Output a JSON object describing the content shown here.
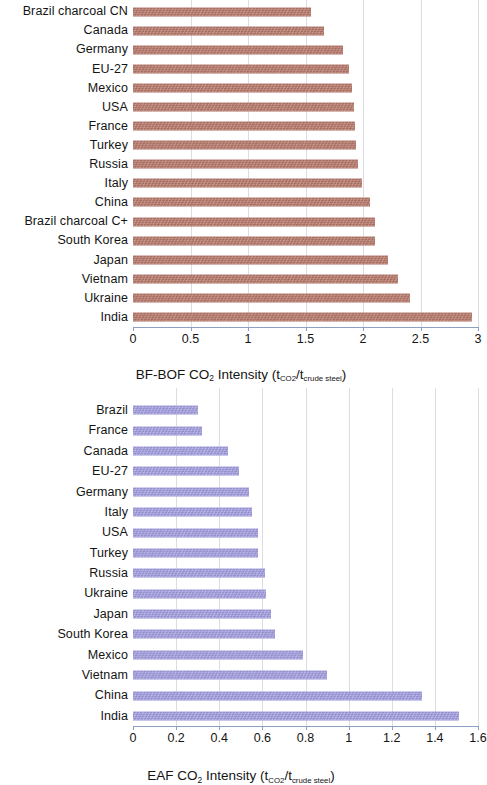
{
  "chart_data": [
    {
      "type": "bar",
      "orientation": "horizontal",
      "id": "bf-bof",
      "title": "",
      "xlabel": "BF-BOF CO2 Intensity (tCO2/tcrude steel)",
      "xlabel_parts": {
        "prefix": "BF-BOF CO",
        "co2_sub": "2",
        "middle": " Intensity (t",
        "unit_sub_1": "CO2",
        "slash": "/t",
        "unit_sub_2": "crude steel",
        "suffix": ")"
      },
      "ylabel": "",
      "xlim": [
        0,
        3
      ],
      "xticks": [
        0,
        0.5,
        1,
        1.5,
        2,
        2.5,
        3
      ],
      "xtick_labels": [
        "0",
        "0.5",
        "1",
        "1.5",
        "2",
        "2.5",
        "3"
      ],
      "grid": true,
      "bar_color": "#b5776a",
      "categories": [
        "Brazil charcoal CN",
        "Canada",
        "Germany",
        "EU-27",
        "Mexico",
        "USA",
        "France",
        "Turkey",
        "Russia",
        "Italy",
        "China",
        "Brazil charcoal C+",
        "South Korea",
        "Japan",
        "Vietnam",
        "Ukraine",
        "India"
      ],
      "values": [
        1.55,
        1.66,
        1.83,
        1.88,
        1.9,
        1.92,
        1.93,
        1.94,
        1.96,
        1.99,
        2.06,
        2.1,
        2.1,
        2.22,
        2.3,
        2.41,
        2.95
      ]
    },
    {
      "type": "bar",
      "orientation": "horizontal",
      "id": "eaf",
      "title": "",
      "xlabel": "EAF CO2 Intensity (tCO2/tcrude steel)",
      "xlabel_parts": {
        "prefix": "EAF CO",
        "co2_sub": "2",
        "middle": " Intensity (t",
        "unit_sub_1": "CO2",
        "slash": "/t",
        "unit_sub_2": "crude steel",
        "suffix": ")"
      },
      "ylabel": "",
      "xlim": [
        0,
        1.6
      ],
      "xticks": [
        0,
        0.2,
        0.4,
        0.6,
        0.8,
        1,
        1.2,
        1.4,
        1.6
      ],
      "xtick_labels": [
        "0",
        "0.2",
        "0.4",
        "0.6",
        "0.8",
        "1",
        "1.2",
        "1.4",
        "1.6"
      ],
      "grid": true,
      "bar_color": "#9e9adb",
      "categories": [
        "Brazil",
        "France",
        "Canada",
        "EU-27",
        "Germany",
        "Italy",
        "USA",
        "Turkey",
        "Russia",
        "Ukraine",
        "Japan",
        "South Korea",
        "Mexico",
        "Vietnam",
        "China",
        "India"
      ],
      "values": [
        0.3,
        0.32,
        0.44,
        0.49,
        0.54,
        0.55,
        0.58,
        0.58,
        0.61,
        0.615,
        0.64,
        0.66,
        0.79,
        0.9,
        1.34,
        1.51
      ]
    }
  ]
}
